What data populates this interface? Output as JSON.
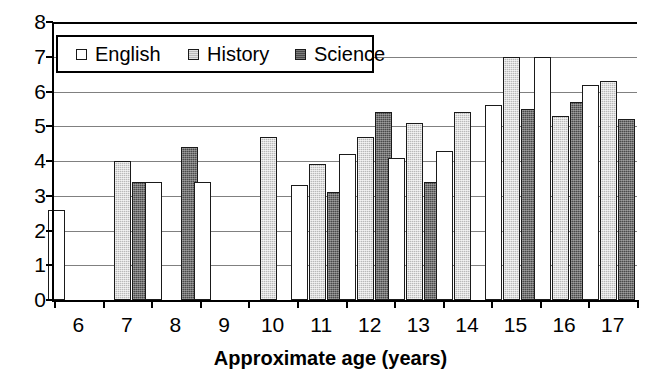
{
  "chart_data": {
    "type": "bar",
    "title": "",
    "subtitle": "",
    "xlabel": "Approximate age (years)",
    "ylabel": "",
    "categories": [
      "6",
      "7",
      "8",
      "9",
      "10",
      "11",
      "12",
      "13",
      "14",
      "15",
      "16",
      "17"
    ],
    "series": [
      {
        "name": "English",
        "color": "#ffffff",
        "values": [
          2.6,
          null,
          3.4,
          3.4,
          null,
          3.3,
          4.2,
          4.1,
          4.3,
          5.6,
          7.0,
          6.2
        ]
      },
      {
        "name": "History",
        "color": "#b9b9b9",
        "values": [
          null,
          4.0,
          null,
          null,
          4.7,
          3.9,
          4.7,
          5.1,
          5.4,
          7.0,
          5.3,
          6.3
        ]
      },
      {
        "name": "Science",
        "color": "#4a4a4a",
        "values": [
          null,
          3.4,
          4.4,
          null,
          null,
          3.1,
          5.4,
          3.4,
          null,
          5.5,
          5.7,
          5.2
        ]
      }
    ],
    "ylim": [
      0,
      8
    ],
    "yticks": [
      "0",
      "1",
      "2",
      "3",
      "4",
      "5",
      "6",
      "7",
      "8"
    ],
    "grid": true,
    "legend_position": "top-left-inside"
  },
  "legend": {
    "entries": [
      {
        "label": "English",
        "swatch": "english-swatch"
      },
      {
        "label": "History",
        "swatch": "history-swatch"
      },
      {
        "label": "Science",
        "swatch": "science-swatch"
      }
    ]
  },
  "axes": {
    "x_title": "Approximate age (years)"
  }
}
